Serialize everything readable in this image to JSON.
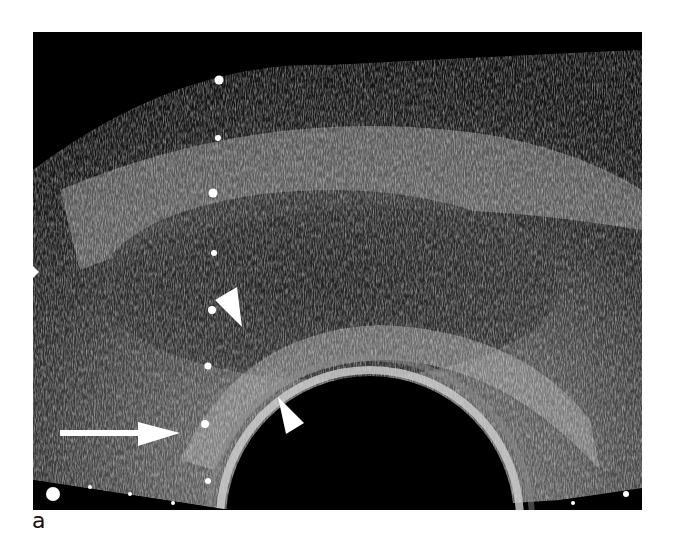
{
  "figure": {
    "type": "transrectal ultrasound image",
    "panel_label": "a",
    "annotations": {
      "arrow": {
        "description": "long white arrow pointing right",
        "from": [
          60,
          433
        ],
        "to": [
          180,
          433
        ]
      },
      "arrowheads": [
        {
          "description": "white arrowhead pointing down-right",
          "tip": [
            242,
            326
          ]
        },
        {
          "description": "white arrowhead pointing down-right",
          "tip": [
            304,
            428
          ]
        }
      ],
      "caliper_dots": [
        [
          219,
          80
        ],
        [
          218,
          138
        ],
        [
          213,
          193
        ],
        [
          214,
          253
        ],
        [
          212,
          310
        ],
        [
          208,
          366
        ],
        [
          205,
          424
        ],
        [
          208,
          481
        ]
      ],
      "edge_markers": [
        [
          53,
          494
        ],
        [
          35,
          272
        ]
      ]
    },
    "colors": {
      "background": "#000000",
      "page": "#ffffff",
      "annotation": "#ffffff"
    }
  }
}
